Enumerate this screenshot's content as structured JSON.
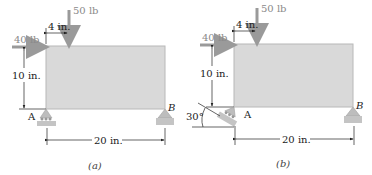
{
  "figure": {
    "panels": [
      {
        "id": "a",
        "caption": "(a)",
        "loads": {
          "horizontal": "40 lb",
          "vertical": "50 lb"
        },
        "dimensions": {
          "load_offset": "4 in.",
          "height": "10 in.",
          "span": "20 in."
        },
        "supports": {
          "left": "A",
          "right": "B",
          "left_angle": ""
        }
      },
      {
        "id": "b",
        "caption": "(b)",
        "loads": {
          "horizontal": "40 lb",
          "vertical": "50 lb"
        },
        "dimensions": {
          "load_offset": "4 in.",
          "height": "10 in.",
          "span": "20 in."
        },
        "supports": {
          "left": "A",
          "right": "B",
          "left_angle": "30°"
        }
      }
    ],
    "colors": {
      "plate_fill": "#d9d9d9",
      "plate_edge": "#b8b8b8",
      "force_arrow": "#9a9a9a",
      "support_fill": "#bdbdbd",
      "dimension_line": "#222222"
    }
  }
}
